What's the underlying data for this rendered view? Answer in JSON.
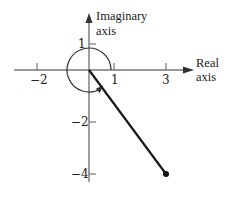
{
  "diagram": {
    "type": "complex-plane",
    "axes": {
      "real_label_line1": "Real",
      "real_label_line2": "axis",
      "imag_label_line1": "Imaginary",
      "imag_label_line2": "axis"
    },
    "ticks": {
      "real": [
        {
          "value": -2,
          "label": "−2"
        },
        {
          "value": 1,
          "label": "1"
        },
        {
          "value": 3,
          "label": "3"
        }
      ],
      "imag": [
        {
          "value": 1,
          "label": "1"
        },
        {
          "value": -2,
          "label": "−2"
        },
        {
          "value": -4,
          "label": "−4"
        }
      ]
    },
    "point": {
      "re": 3,
      "im": -4
    },
    "unit_circle_arc": {
      "radius": 1,
      "direction": "counterclockwise",
      "arrow": "near bottom-right"
    },
    "colors": {
      "axis": "#777777",
      "vector": "#1a1a1a",
      "text": "#222222"
    }
  }
}
